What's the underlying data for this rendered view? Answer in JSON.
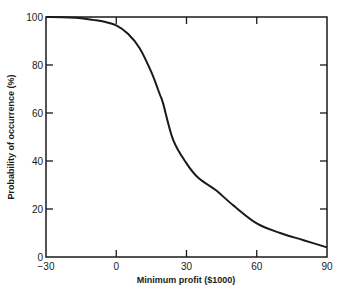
{
  "chart_data": {
    "type": "line",
    "title": "",
    "xlabel": "Minimum profit ($1000)",
    "ylabel": "Probability of occurrence (%)",
    "xlim": [
      -30,
      90
    ],
    "ylim": [
      0,
      100
    ],
    "x_ticks": [
      -30,
      0,
      30,
      60,
      90
    ],
    "y_ticks": [
      0,
      20,
      40,
      60,
      80,
      100
    ],
    "grid": false,
    "legend": null,
    "series": [
      {
        "name": "Probability curve",
        "x": [
          -30,
          -20,
          -15,
          -10,
          -5,
          0,
          5,
          10,
          15,
          18.7,
          20,
          24.3,
          30,
          35,
          42.3,
          50,
          60,
          70,
          80,
          90
        ],
        "y": [
          100,
          99.8,
          99.5,
          98.8,
          98,
          96.5,
          93,
          87,
          77,
          67.5,
          64,
          48.8,
          39,
          33,
          28,
          21.5,
          14,
          10,
          7,
          4
        ]
      }
    ]
  },
  "axes": {
    "x_tick_labels": [
      "−30",
      "0",
      "30",
      "60",
      "90"
    ],
    "y_tick_labels": [
      "0",
      "20",
      "40",
      "60",
      "80",
      "100"
    ],
    "x_title": "Minimum profit ($1000)",
    "y_title": "Probability of occurrence (%)"
  }
}
